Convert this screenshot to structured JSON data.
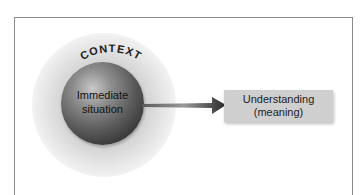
{
  "diagram": {
    "context_label": "CONTEXT",
    "center_label_line1": "Immediate",
    "center_label_line2": "situation",
    "result_label_line1": "Understanding",
    "result_label_line2": "(meaning)"
  },
  "colors": {
    "frame_border": "#8a8a8a",
    "result_box_fill": "#cfcfcf",
    "sphere_dark": "#2e2e2e",
    "arrow": "#3a3a3a"
  }
}
